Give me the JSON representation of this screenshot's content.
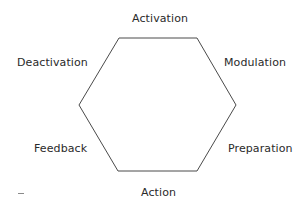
{
  "diagram": {
    "type": "hexagon-cycle",
    "shape": {
      "stroke": "#4a4a4a",
      "fill": "#ffffff",
      "vertices": [
        [
          119,
          38
        ],
        [
          197,
          38
        ],
        [
          236,
          105
        ],
        [
          197,
          171
        ],
        [
          118,
          171
        ],
        [
          79,
          105
        ]
      ]
    },
    "labels": {
      "top": "Activation",
      "top_right": "Modulation",
      "bottom_right": "Preparation",
      "bottom": "Action",
      "bottom_left": "Feedback",
      "top_left": "Deactivation"
    },
    "cycle_order": [
      "Activation",
      "Modulation",
      "Preparation",
      "Action",
      "Feedback",
      "Deactivation"
    ],
    "footnote_mark": "–"
  }
}
